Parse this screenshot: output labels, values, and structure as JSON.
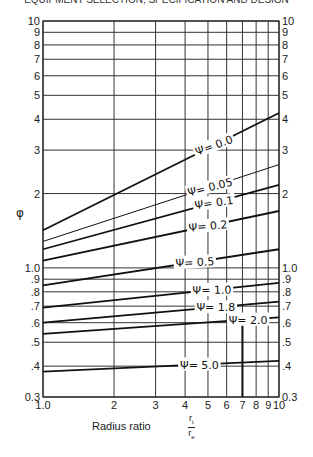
{
  "header": {
    "text": "EQUIPMENT SELECTION, SPECIFICATION AND DESIGN"
  },
  "chart_data": {
    "type": "line",
    "title": "",
    "xlabel": "Radius ratio",
    "xlabel_fraction": {
      "numerator": "r_t",
      "denominator": "r_e"
    },
    "ylabel": "φ",
    "xscale": "log",
    "yscale": "log",
    "xlim": [
      1.0,
      10
    ],
    "ylim": [
      0.3,
      10
    ],
    "grid": true,
    "x_ticks": [
      "1.0",
      "2",
      "3",
      "4",
      "5",
      "6",
      "7",
      "8",
      "9",
      "10"
    ],
    "y_ticks_left": [
      "10",
      "9",
      "8",
      "7",
      "6",
      "5",
      "4",
      "3",
      "2",
      "1.0",
      ".9",
      ".8",
      ".7",
      ".6",
      ".5",
      ".4",
      "0.3"
    ],
    "y_ticks_right": [
      "10",
      "9",
      "8",
      "7",
      "6",
      "5",
      "4",
      "3",
      "2",
      "1.0",
      ".9",
      ".8",
      ".7",
      ".6",
      ".5",
      ".4",
      "0.3"
    ],
    "x": [
      1.0,
      10.0
    ],
    "series": [
      {
        "name": "Ψ= 0.0",
        "values": [
          1.42,
          4.24
        ]
      },
      {
        "name": "Ψ= 0.05",
        "values": [
          1.28,
          2.62
        ]
      },
      {
        "name": "Ψ= 0.1",
        "values": [
          1.19,
          2.17
        ]
      },
      {
        "name": "Ψ= 0.2",
        "values": [
          1.07,
          1.7
        ]
      },
      {
        "name": "Ψ= 0.5",
        "values": [
          0.85,
          1.19
        ]
      },
      {
        "name": "Ψ= 1.0",
        "values": [
          0.69,
          0.87
        ]
      },
      {
        "name": "Ψ= 1.8",
        "values": [
          0.6,
          0.73
        ]
      },
      {
        "name": "Ψ= 2.0",
        "values": [
          0.54,
          0.63
        ]
      },
      {
        "name": "Ψ= 5.0",
        "values": [
          0.38,
          0.42
        ]
      }
    ],
    "annotations": [
      "vertical marker line at radius ratio ≈ 7 from Ψ=2.0 curve down to axis"
    ]
  }
}
